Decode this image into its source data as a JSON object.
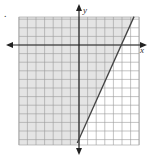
{
  "problem_mark": ".",
  "chart_data": {
    "type": "line",
    "title": "",
    "xlabel": "x",
    "ylabel": "y",
    "xlim": [
      -7,
      7
    ],
    "ylim": [
      -11.6,
      3.3
    ],
    "grid": true,
    "grid_step": 1,
    "tick_labels_shown": false,
    "series": [
      {
        "name": "boundary line",
        "style": "solid",
        "points": [
          [
            -0.2,
            -11.4
          ],
          [
            0,
            -11
          ],
          [
            5,
            0
          ],
          [
            6.4,
            3.3
          ]
        ],
        "approx_equation": "y = 2.2x - 11"
      }
    ],
    "shaded_region": {
      "side": "left/above the line",
      "description": "inequality solution region shaded gray"
    },
    "colors": {
      "shade": "#e4e4e4",
      "grid": "#9a9a9a",
      "axis": "#222222",
      "line": "#444444"
    }
  }
}
